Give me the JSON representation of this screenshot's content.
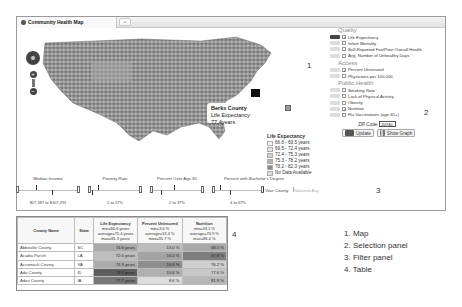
{
  "window": {
    "tab_title": "Community Health Map",
    "tab_icon": "gear-icon",
    "new_tab_label": "+"
  },
  "map": {
    "region_label": "1",
    "tooltip": {
      "county": "Berks County",
      "text": "Life Expectancy: 77.4years"
    },
    "legend": {
      "title": "Life Expectancy",
      "items": [
        {
          "label": "66.6 - 69.5 years",
          "color": "#f4f4f4"
        },
        {
          "label": "69.5 - 72.4 years",
          "color": "#e6e6e6"
        },
        {
          "label": "72.4 - 75.3 years",
          "color": "#cfcfcf"
        },
        {
          "label": "75.3 - 78.2 years",
          "color": "#b2b2b2"
        },
        {
          "label": "78.2 - 82.3 years",
          "color": "#8a8a8a"
        },
        {
          "label": "No Data Available",
          "color": "#e0e0e0"
        }
      ]
    }
  },
  "selection": {
    "region_label": "2",
    "sections": [
      {
        "title": "Quality",
        "items": [
          {
            "label": "Life Expectancy",
            "checked": true,
            "active": true
          },
          {
            "label": "Infant Mortality",
            "checked": false,
            "active": false
          },
          {
            "label": "Self-Reported Fair/Poor Overall Health",
            "checked": false,
            "active": false
          },
          {
            "label": "Avg. Number of Unhealthy Days",
            "checked": false,
            "active": false
          }
        ]
      },
      {
        "title": "Access",
        "items": [
          {
            "label": "Percent Uninsured",
            "checked": true,
            "active": false
          },
          {
            "label": "Physicians per 100,000",
            "checked": false,
            "active": false
          }
        ]
      },
      {
        "title": "Public Health",
        "items": [
          {
            "label": "Smoking Rate",
            "checked": false,
            "active": false
          },
          {
            "label": "Lack of Physical Activity",
            "checked": false,
            "active": false
          },
          {
            "label": "Obesity",
            "checked": false,
            "active": false
          },
          {
            "label": "Nutrition",
            "checked": true,
            "active": false
          },
          {
            "label": "Flu Vaccinations (age 65+)",
            "checked": false,
            "active": false
          }
        ]
      }
    ],
    "zip_label": "ZIP Code",
    "zip_value": "20740",
    "update_label": "Update",
    "show_graph_label": "Show Graph"
  },
  "filters": {
    "region_label": "3",
    "items": [
      {
        "title": "Median Income",
        "range": "$17,487 to $107,291"
      },
      {
        "title": "Poverty Rate",
        "range": "1 to 57%"
      },
      {
        "title": "Percent Over Age 65",
        "range": "2 to 37%"
      },
      {
        "title": "Percent with Bachelor's Degree",
        "range": "4 to 67%"
      }
    ],
    "legend_your_county": "Your County",
    "legend_national": "National Avg"
  },
  "table": {
    "region_label": "4",
    "columns": [
      {
        "title": "County Name",
        "sub": ""
      },
      {
        "title": "State",
        "sub": ""
      },
      {
        "title": "Life Expectancy",
        "sub": "min=66.6 years average=75.4 years max=81.3 years"
      },
      {
        "title": "Percent Uninsured",
        "sub": "min=3.0 % average=13.4 % max=35.7 %"
      },
      {
        "title": "Nutrition",
        "sub": "min=43.1 % average=70.9 % max=86.4 %"
      }
    ],
    "rows": [
      {
        "county": "Abbeville County",
        "state": "SC",
        "life": "74.6 years",
        "uninsured": "13.0 %",
        "nutrition": "68.5 %"
      },
      {
        "county": "Acadia Parish",
        "state": "LA",
        "life": "72.6 years",
        "uninsured": "16.0 %",
        "nutrition": "57.8 %"
      },
      {
        "county": "Accomack County",
        "state": "VA",
        "life": "74.9 years",
        "uninsured": "16.5 %",
        "nutrition": "76.2 %"
      },
      {
        "county": "Ada County",
        "state": "ID",
        "life": "79.2 years",
        "uninsured": "15.6 %",
        "nutrition": "77.6 %"
      },
      {
        "county": "Adair County",
        "state": "IA",
        "life": "77.7 years",
        "uninsured": "8.6 %",
        "nutrition": "81.9 %"
      }
    ]
  },
  "annotations": [
    "1. Map",
    "2. Selection panel",
    "3. Filter panel",
    "4. Table"
  ]
}
